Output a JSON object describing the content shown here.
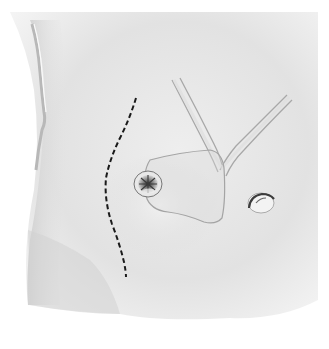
{
  "figure": {
    "type": "surgical-illustration",
    "colors": {
      "background": "#ffffff",
      "skin": "#e6e6e6",
      "skin_shadow": "#cfcfcf",
      "outline": "#a9a9a9",
      "incision_line": "#1a1a1a",
      "stoma_dark": "#3a3a3a"
    },
    "elements": [
      {
        "name": "abdominal-wall",
        "description": "shaded skin surface"
      },
      {
        "name": "left-flank-edge",
        "description": "vertical highlighted body contour on left"
      },
      {
        "name": "incision-line",
        "description": "curved dashed line"
      },
      {
        "name": "stoma",
        "description": "circular opening with puckered center"
      },
      {
        "name": "patch-outline",
        "description": "rounded quadrilateral outline around stoma"
      },
      {
        "name": "tubular-structures",
        "description": "two converging tubes forming a Y shape"
      },
      {
        "name": "small-opening",
        "description": "small oval opening on right"
      }
    ]
  }
}
